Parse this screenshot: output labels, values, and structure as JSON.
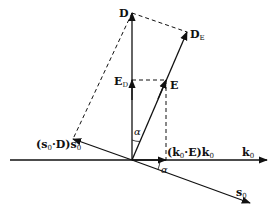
{
  "diagram": {
    "colors": {
      "line": "#111111",
      "background": "#ffffff"
    },
    "points": {
      "origin": [
        132,
        160
      ],
      "D": [
        132,
        13
      ],
      "D_E": [
        187,
        32
      ],
      "E": [
        166,
        80
      ],
      "E_D": [
        132,
        80
      ],
      "s0_proj": [
        73,
        139
      ],
      "k0_proj": [
        166,
        160
      ],
      "k0_end": [
        267,
        160
      ],
      "k0_start": [
        10,
        160
      ],
      "s0_end": [
        250,
        203
      ]
    },
    "labels": {
      "D": {
        "main": "D",
        "sub": ""
      },
      "D_E": {
        "main": "D",
        "sub": "E"
      },
      "E": {
        "main": "E",
        "sub": ""
      },
      "E_D": {
        "main": "E",
        "sub": "D"
      },
      "s0_proj": {
        "text_pre": "(",
        "s": "s",
        "s_sub": "0",
        "dot": "·",
        "D": "D",
        "close": ")",
        "s2": "s",
        "s2_sub": "0"
      },
      "k0_proj": {
        "text_pre": "(",
        "k": "k",
        "k_sub": "0",
        "dot": "·",
        "E": "E",
        "close": ")",
        "k2": "k",
        "k2_sub": "0"
      },
      "k0": {
        "main": "k",
        "sub": "0"
      },
      "s0": {
        "main": "s",
        "sub": "0"
      },
      "alpha_top": "α",
      "alpha_bottom": "α"
    }
  }
}
